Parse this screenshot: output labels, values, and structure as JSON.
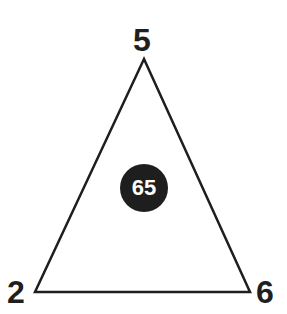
{
  "diagram": {
    "shape": "triangle",
    "vertices": {
      "top": {
        "label": "5"
      },
      "bottom_left": {
        "label": "2"
      },
      "bottom_right": {
        "label": "6"
      }
    },
    "center": {
      "label": "65"
    },
    "colors": {
      "stroke": "#1e1e1e",
      "badge_fill": "#1e1e1e",
      "badge_text": "#ffffff",
      "background": "#ffffff"
    }
  }
}
